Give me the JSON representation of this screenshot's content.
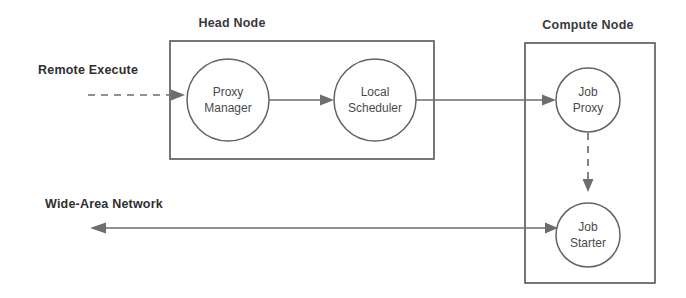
{
  "diagram": {
    "canvas": {
      "width": 686,
      "height": 298,
      "background": "#ffffff"
    },
    "colors": {
      "stroke": "#6d6d6f",
      "box_stroke": "#555557",
      "circle_stroke": "#636365",
      "label_text": "#2f2f31",
      "node_text": "#4a4a4c",
      "background": "#ffffff"
    },
    "containers": [
      {
        "id": "head-node",
        "label": "Head Node",
        "label_x": 232,
        "label_y": 27,
        "x": 170,
        "y": 41,
        "width": 264,
        "height": 118
      },
      {
        "id": "compute-node",
        "label": "Compute Node",
        "label_x": 588,
        "label_y": 29,
        "x": 525,
        "y": 43,
        "width": 130,
        "height": 240
      }
    ],
    "nodes": [
      {
        "id": "proxy-manager",
        "lines": [
          "Proxy",
          "Manager"
        ],
        "line1": "Proxy",
        "line2": "Manager",
        "cx": 228,
        "cy": 100,
        "r": 41
      },
      {
        "id": "local-scheduler",
        "lines": [
          "Local",
          "Scheduler"
        ],
        "line1": "Local",
        "line2": "Scheduler",
        "cx": 375,
        "cy": 100,
        "r": 41
      },
      {
        "id": "job-proxy",
        "lines": [
          "Job",
          "Proxy"
        ],
        "line1": "Job",
        "line2": "Proxy",
        "cx": 588,
        "cy": 100,
        "r": 32
      },
      {
        "id": "job-starter",
        "lines": [
          "Job",
          "Starter"
        ],
        "line1": "Job",
        "line2": "Starter",
        "cx": 588,
        "cy": 235,
        "r": 32
      }
    ],
    "edge_labels": [
      {
        "id": "remote-execute",
        "text": "Remote Execute",
        "x": 38,
        "y": 74
      },
      {
        "id": "wide-area-network",
        "text": "Wide-Area Network",
        "x": 45,
        "y": 208
      }
    ],
    "edges": [
      {
        "id": "remote-execute-to-proxy-manager",
        "style": "dashed",
        "from": "Remote Execute",
        "to": "Proxy Manager",
        "direction": "right"
      },
      {
        "id": "proxy-manager-to-local-scheduler",
        "style": "solid",
        "from": "Proxy Manager",
        "to": "Local Scheduler",
        "direction": "right"
      },
      {
        "id": "local-scheduler-to-job-proxy",
        "style": "solid",
        "from": "Local Scheduler",
        "to": "Job Proxy",
        "direction": "right"
      },
      {
        "id": "job-proxy-to-job-starter",
        "style": "dashed",
        "from": "Job Proxy",
        "to": "Job Starter",
        "direction": "down"
      },
      {
        "id": "job-starter-to-wide-area-network",
        "style": "solid",
        "from": "Job Starter",
        "to": "Wide-Area Network",
        "direction": "bidirectional"
      }
    ]
  }
}
